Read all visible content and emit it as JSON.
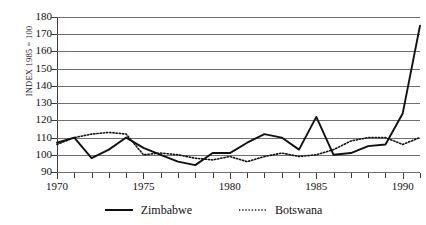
{
  "chart_data": {
    "type": "line",
    "title": "",
    "subtitle": "",
    "xlabel": "",
    "ylabel": "INDEX 1985 = 100",
    "xlim": [
      1970,
      1991
    ],
    "ylim": [
      90,
      180
    ],
    "ytick_step": 10,
    "xtick_step": 5,
    "grid": true,
    "grid_axis": "y",
    "legend_position": "bottom-center",
    "yticks": [
      90,
      100,
      110,
      120,
      130,
      140,
      150,
      160,
      170,
      180
    ],
    "xticks": [
      1970,
      1975,
      1980,
      1985,
      1990
    ],
    "x": [
      1970,
      1971,
      1972,
      1973,
      1974,
      1975,
      1976,
      1977,
      1978,
      1979,
      1980,
      1981,
      1982,
      1983,
      1984,
      1985,
      1986,
      1987,
      1988,
      1989,
      1990,
      1991
    ],
    "series": [
      {
        "name": "Zimbabwe",
        "style": "solid",
        "color": "#111111",
        "values": [
          107,
          110,
          98,
          103,
          110,
          104,
          100,
          96,
          94,
          101,
          101,
          107,
          112,
          110,
          103,
          122,
          100,
          101,
          105,
          106,
          124,
          175
        ]
      },
      {
        "name": "Botswana",
        "style": "dotted",
        "color": "#111111",
        "values": [
          106,
          110,
          112,
          113,
          112,
          100,
          101,
          100,
          98,
          97,
          99,
          96,
          99,
          101,
          99,
          100,
          103,
          108,
          110,
          110,
          106,
          110
        ]
      }
    ]
  },
  "legend": {
    "entries": [
      {
        "label": "Zimbabwe",
        "marker": "solid-line-swatch"
      },
      {
        "label": "Botswana",
        "marker": "dotted-line-swatch"
      }
    ]
  },
  "axis": {
    "y_title": "INDEX 1985 = 100"
  }
}
